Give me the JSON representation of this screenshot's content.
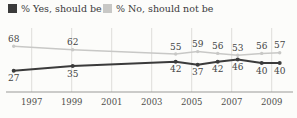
{
  "colors": {
    "background": "#fcfcfa",
    "yes_line": "#3b3b3b",
    "no_line": "#c8c8c6",
    "gridline": "#dedddb",
    "axis": "#9a9a98",
    "value_text": "#454545",
    "tick_text": "#4f4f4d"
  },
  "chart_data": {
    "type": "line",
    "title": "",
    "xlabel": "",
    "ylabel": "",
    "x_ticks": [
      1997,
      1999,
      2001,
      2003,
      2005,
      2007,
      2009
    ],
    "x_range": [
      1996,
      2010
    ],
    "grid": "vertical",
    "legend_position": "top",
    "value_labels": true,
    "x": [
      1996.1,
      1999.05,
      2004.2,
      2005.3,
      2006.3,
      2007.3,
      2008.5,
      2009.4
    ],
    "series": [
      {
        "name": "% Yes, should be",
        "color": "#3b3b3b",
        "values": [
          27,
          35,
          42,
          37,
          42,
          46,
          40,
          40
        ],
        "label_side": "below"
      },
      {
        "name": "% No, should not be",
        "color": "#c8c8c6",
        "values": [
          68,
          62,
          55,
          59,
          56,
          53,
          56,
          57
        ],
        "label_side": "above"
      }
    ]
  }
}
